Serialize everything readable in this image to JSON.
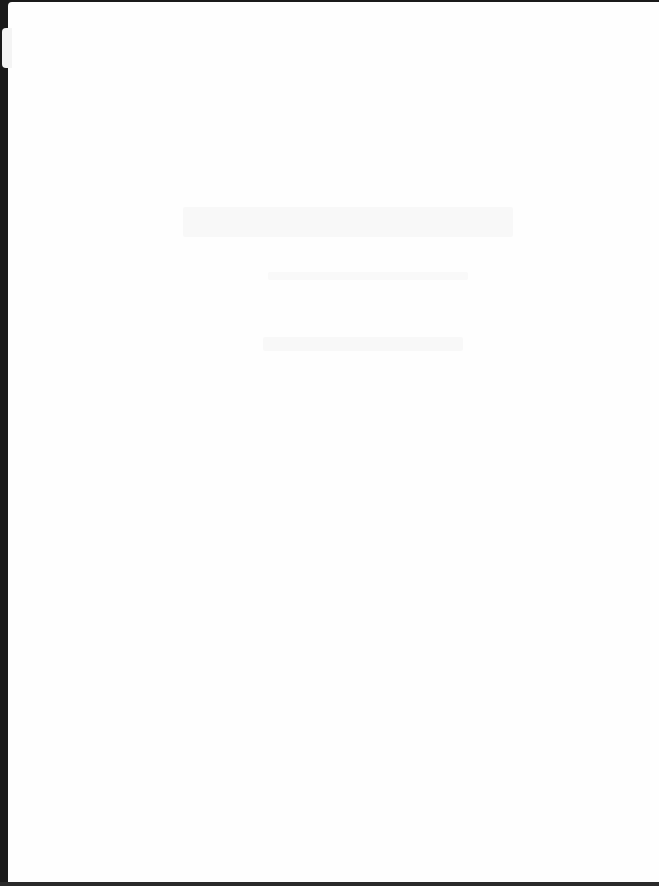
{
  "document": {
    "type": "scanned-page",
    "legible_text": "",
    "colors": {
      "page": "#fefefe",
      "background": "#1a1a1a",
      "faint_marks": "#f3f3f3"
    }
  }
}
